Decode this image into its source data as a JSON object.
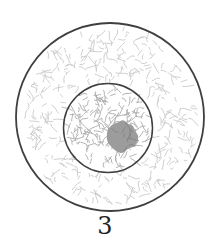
{
  "figure": {
    "label": "3",
    "kind": "cell-diagram",
    "parts": [
      {
        "name": "cell-boundary"
      },
      {
        "name": "nucleus"
      },
      {
        "name": "nucleolus"
      }
    ]
  },
  "colors": {
    "background": "#ffffff",
    "outline": "#3f3f3f",
    "cytoplasm_texture": "#c9c9c9",
    "nucleus_texture": "#aaaaaa",
    "nucleolus_fill": "#9c9c9c",
    "nucleolus_speckle": "#838383",
    "label_color": "#1f1f1f"
  }
}
